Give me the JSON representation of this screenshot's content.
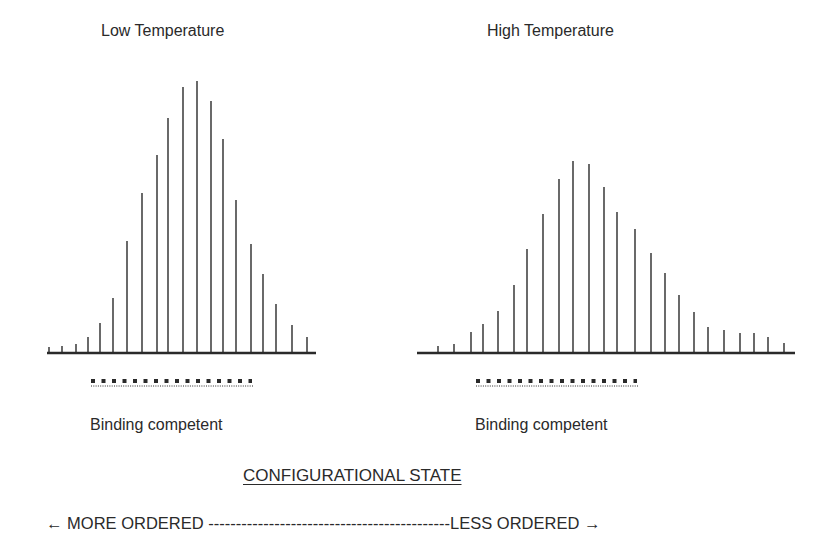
{
  "chart_data": [
    {
      "type": "bar",
      "subtype": "stick-spectrum",
      "title": "Low Temperature",
      "xlabel": "CONFIGURATIONAL STATE",
      "ylabel": "",
      "grid": false,
      "legend": null,
      "x_positions_px": [
        49,
        62,
        76,
        88,
        100,
        113,
        127,
        142,
        157,
        168,
        183,
        197,
        211,
        223,
        236,
        251,
        263,
        276,
        292,
        307
      ],
      "values": [
        6,
        7,
        9,
        16,
        30,
        55,
        112,
        160,
        198,
        235,
        266,
        272,
        252,
        214,
        153,
        109,
        79,
        49,
        28,
        16
      ],
      "baseline_px": {
        "x1": 47,
        "x2": 316,
        "y": 353
      },
      "binding_competent_range_px": [
        91,
        252
      ],
      "annotation": "Binding competent"
    },
    {
      "type": "bar",
      "subtype": "stick-spectrum",
      "title": "High Temperature",
      "xlabel": "CONFIGURATIONAL STATE",
      "ylabel": "",
      "grid": false,
      "legend": null,
      "x_positions_px": [
        438,
        454,
        471,
        483,
        498,
        514,
        527,
        543,
        559,
        573,
        589,
        604,
        617,
        635,
        651,
        665,
        679,
        694,
        708,
        724,
        740,
        754,
        768,
        784
      ],
      "values": [
        7,
        9,
        21,
        29,
        42,
        68,
        104,
        139,
        174,
        192,
        189,
        166,
        141,
        124,
        100,
        80,
        58,
        41,
        26,
        23,
        20,
        20,
        16,
        10
      ],
      "baseline_px": {
        "x1": 417,
        "x2": 795,
        "y": 353
      },
      "binding_competent_range_px": [
        476,
        637
      ],
      "annotation": "Binding competent"
    }
  ],
  "labels": {
    "left_title": "Low Temperature",
    "right_title": "High Temperature",
    "binding_left": "Binding competent",
    "binding_right": "Binding competent",
    "x_axis_title": "CONFIGURATIONAL STATE",
    "order_axis": "← MORE ORDERED --------------------------------------------LESS ORDERED →"
  },
  "colors": {
    "line": "#2a2a2a",
    "text": "#2a2a2a",
    "background": "#ffffff"
  }
}
